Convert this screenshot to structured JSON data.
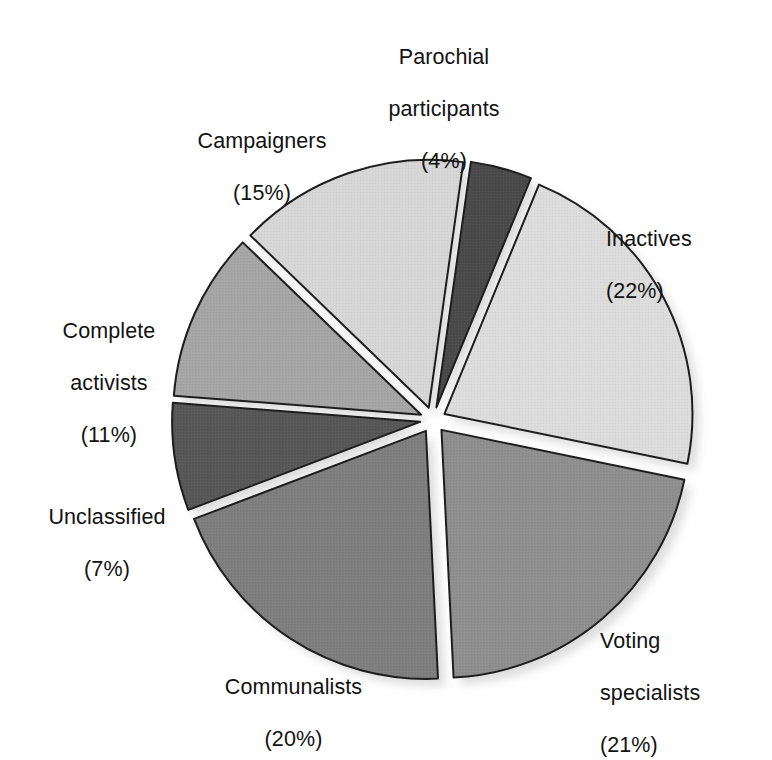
{
  "chart_data": {
    "type": "pie",
    "title": "",
    "subtitle": "",
    "xlabel": "",
    "ylabel": "",
    "legend_position": "none",
    "grid": false,
    "units": "percent",
    "total": 100,
    "exploded": true,
    "start_angle_deg": 8,
    "direction": "clockwise",
    "categories": [
      "Parochial participants",
      "Inactives",
      "Voting specialists",
      "Communalists",
      "Unclassified",
      "Complete activists",
      "Campaigners"
    ],
    "values": [
      4,
      22,
      21,
      20,
      7,
      11,
      15
    ],
    "colors": [
      "#4a4a4a",
      "#dcdcdc",
      "#8e8e8e",
      "#7e7e7e",
      "#575757",
      "#a5a5a5",
      "#d6d6d6"
    ],
    "slices": [
      {
        "name": "Parochial participants",
        "label_line1": "Parochial",
        "label_line2": "participants",
        "percent": 4,
        "percent_text": "(4%)",
        "color": "#4a4a4a",
        "start_deg": 8,
        "end_deg": 22.4
      },
      {
        "name": "Inactives",
        "label_line1": "Inactives",
        "label_line2": "",
        "percent": 22,
        "percent_text": "(22%)",
        "color": "#dcdcdc",
        "start_deg": 22.4,
        "end_deg": 101.6
      },
      {
        "name": "Voting specialists",
        "label_line1": "Voting",
        "label_line2": "specialists",
        "percent": 21,
        "percent_text": "(21%)",
        "color": "#8e8e8e",
        "start_deg": 101.6,
        "end_deg": 177.2
      },
      {
        "name": "Communalists",
        "label_line1": "Communalists",
        "label_line2": "",
        "percent": 20,
        "percent_text": "(20%)",
        "color": "#7e7e7e",
        "start_deg": 177.2,
        "end_deg": 249.2
      },
      {
        "name": "Unclassified",
        "label_line1": "Unclassified",
        "label_line2": "",
        "percent": 7,
        "percent_text": "(7%)",
        "color": "#575757",
        "start_deg": 249.2,
        "end_deg": 274.4
      },
      {
        "name": "Complete activists",
        "label_line1": "Complete",
        "label_line2": "activists",
        "percent": 11,
        "percent_text": "(11%)",
        "color": "#a5a5a5",
        "start_deg": 274.4,
        "end_deg": 314.0
      },
      {
        "name": "Campaigners",
        "label_line1": "Campaigners",
        "label_line2": "",
        "percent": 15,
        "percent_text": "(15%)",
        "color": "#d6d6d6",
        "start_deg": 314.0,
        "end_deg": 368.0
      }
    ]
  },
  "labels": {
    "parochial": {
      "line1": "Parochial",
      "line2": "participants",
      "pct": "(4%)"
    },
    "inactives": {
      "line1": "Inactives",
      "line2": "",
      "pct": "(22%)"
    },
    "voting": {
      "line1": "Voting",
      "line2": "specialists",
      "pct": "(21%)"
    },
    "communalists": {
      "line1": "Communalists",
      "line2": "",
      "pct": "(20%)"
    },
    "unclassified": {
      "line1": "Unclassified",
      "line2": "",
      "pct": "(7%)"
    },
    "activists": {
      "line1": "Complete",
      "line2": "activists",
      "pct": "(11%)"
    },
    "campaigners": {
      "line1": "Campaigners",
      "line2": "",
      "pct": "(15%)"
    }
  },
  "geometry": {
    "center_x": 433,
    "center_y": 420,
    "radius": 248,
    "explode_offset": 13,
    "stroke_color": "#1d1d1d",
    "stroke_width": 2,
    "background": "#ffffff"
  }
}
